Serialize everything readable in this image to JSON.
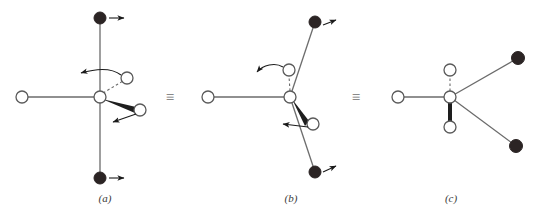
{
  "figure": {
    "type": "chemical-stereochemistry-diagram",
    "background_color": "#ffffff",
    "bond_color": "#6b6b6b",
    "open_atom_fill": "#ffffff",
    "open_atom_stroke": "#5a5a5a",
    "filled_atom_fill": "#2b2424",
    "arrow_color": "#1a1a1a",
    "label_color": "#3a3a3a"
  },
  "equivalence": {
    "symbol": "≡",
    "name": "identical-to",
    "count": 2,
    "positions": [
      "between-a-and-b",
      "between-b-and-c"
    ]
  },
  "panels": [
    {
      "id": "a",
      "label": "(a)",
      "center": {
        "name": "stereocenter",
        "type": "open",
        "x": 100,
        "y": 97
      },
      "atoms": [
        {
          "name": "top-filled-atom",
          "type": "filled",
          "x": 100,
          "y": 18
        },
        {
          "name": "bottom-filled-atom",
          "type": "filled",
          "x": 100,
          "y": 178
        },
        {
          "name": "left-open-atom",
          "type": "open",
          "x": 22,
          "y": 97
        },
        {
          "name": "upper-right-open-atom",
          "type": "open",
          "x": 127,
          "y": 78
        },
        {
          "name": "lower-right-open-atom",
          "type": "open",
          "x": 140,
          "y": 110
        }
      ],
      "bonds": [
        {
          "name": "bond-to-top-filled",
          "style": "plain",
          "from": "stereocenter",
          "to": "top-filled-atom"
        },
        {
          "name": "bond-to-bottom-filled",
          "style": "plain",
          "from": "stereocenter",
          "to": "bottom-filled-atom"
        },
        {
          "name": "bond-to-left-open",
          "style": "plain",
          "from": "stereocenter",
          "to": "left-open-atom"
        },
        {
          "name": "bond-to-upper-right-open",
          "style": "dashed",
          "from": "stereocenter",
          "to": "upper-right-open-atom"
        },
        {
          "name": "bond-to-lower-right-open",
          "style": "wedge",
          "from": "stereocenter",
          "to": "lower-right-open-atom"
        }
      ],
      "arrows": [
        {
          "name": "top-atom-motion-arrow",
          "style": "straight",
          "direction": "right"
        },
        {
          "name": "bottom-atom-motion-arrow",
          "style": "straight",
          "direction": "right"
        },
        {
          "name": "upper-right-rotation-arrow",
          "style": "curved",
          "direction": "left"
        },
        {
          "name": "lower-right-motion-arrow",
          "style": "straight",
          "direction": "left"
        }
      ]
    },
    {
      "id": "b",
      "label": "(b)",
      "center": {
        "name": "stereocenter",
        "type": "open",
        "x": 290,
        "y": 97
      },
      "atoms": [
        {
          "name": "top-filled-atom",
          "type": "filled",
          "x": 315,
          "y": 22
        },
        {
          "name": "bottom-filled-atom",
          "type": "filled",
          "x": 315,
          "y": 172
        },
        {
          "name": "left-open-atom",
          "type": "open",
          "x": 208,
          "y": 97
        },
        {
          "name": "upper-open-atom",
          "type": "open",
          "x": 289,
          "y": 70
        },
        {
          "name": "lower-right-open-atom",
          "type": "open",
          "x": 313,
          "y": 124
        }
      ],
      "bonds": [
        {
          "name": "bond-to-top-filled",
          "style": "plain",
          "from": "stereocenter",
          "to": "top-filled-atom"
        },
        {
          "name": "bond-to-bottom-filled",
          "style": "plain",
          "from": "stereocenter",
          "to": "bottom-filled-atom"
        },
        {
          "name": "bond-to-left-open",
          "style": "plain",
          "from": "stereocenter",
          "to": "left-open-atom"
        },
        {
          "name": "bond-to-upper-open",
          "style": "dashed",
          "from": "stereocenter",
          "to": "upper-open-atom"
        },
        {
          "name": "bond-to-lower-right-open",
          "style": "wedge",
          "from": "stereocenter",
          "to": "lower-right-open-atom"
        }
      ],
      "arrows": [
        {
          "name": "top-atom-motion-arrow",
          "style": "straight",
          "direction": "upper-right"
        },
        {
          "name": "bottom-atom-motion-arrow",
          "style": "straight",
          "direction": "upper-right"
        },
        {
          "name": "upper-rotation-arrow",
          "style": "curved",
          "direction": "left"
        },
        {
          "name": "lower-right-motion-arrow",
          "style": "straight",
          "direction": "left"
        }
      ]
    },
    {
      "id": "c",
      "label": "(c)",
      "center": {
        "name": "stereocenter",
        "type": "open",
        "x": 450,
        "y": 97
      },
      "atoms": [
        {
          "name": "upper-right-filled-atom",
          "type": "filled",
          "x": 518,
          "y": 58
        },
        {
          "name": "lower-right-filled-atom",
          "type": "filled",
          "x": 516,
          "y": 146
        },
        {
          "name": "left-open-atom",
          "type": "open",
          "x": 398,
          "y": 97
        },
        {
          "name": "upper-open-atom",
          "type": "open",
          "x": 450,
          "y": 70
        },
        {
          "name": "lower-open-atom",
          "type": "open",
          "x": 450,
          "y": 127
        }
      ],
      "bonds": [
        {
          "name": "bond-to-upper-right-filled",
          "style": "plain",
          "from": "stereocenter",
          "to": "upper-right-filled-atom"
        },
        {
          "name": "bond-to-lower-right-filled",
          "style": "plain",
          "from": "stereocenter",
          "to": "lower-right-filled-atom"
        },
        {
          "name": "bond-to-left-open",
          "style": "plain",
          "from": "stereocenter",
          "to": "left-open-atom"
        },
        {
          "name": "bond-to-upper-open",
          "style": "dashed",
          "from": "stereocenter",
          "to": "upper-open-atom"
        },
        {
          "name": "bond-to-lower-open",
          "style": "wedge",
          "from": "stereocenter",
          "to": "lower-open-atom"
        }
      ],
      "arrows": []
    }
  ]
}
